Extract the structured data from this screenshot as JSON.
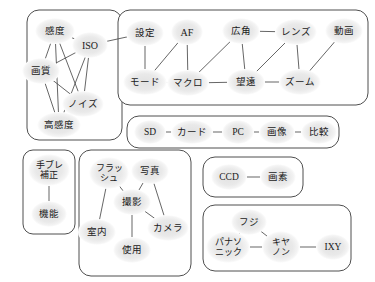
{
  "diagram": {
    "background_color": "#ffffff",
    "node_fill_color": "#e8e8e8",
    "node_text_color": "#1a1a1a",
    "edge_color": "#4a4a4a",
    "cluster_border_color": "#3a3a3a"
  },
  "clusters": [
    {
      "id": "c1",
      "x": 27,
      "y": 10,
      "w": 95,
      "h": 130,
      "r": 12
    },
    {
      "id": "c2",
      "x": 118,
      "y": 10,
      "w": 250,
      "h": 95,
      "r": 12
    },
    {
      "id": "c3",
      "x": 127,
      "y": 116,
      "w": 212,
      "h": 32,
      "r": 12
    },
    {
      "id": "c4",
      "x": 23,
      "y": 150,
      "w": 52,
      "h": 84,
      "r": 10
    },
    {
      "id": "c5",
      "x": 79,
      "y": 150,
      "w": 112,
      "h": 126,
      "r": 12
    },
    {
      "id": "c6",
      "x": 203,
      "y": 157,
      "w": 100,
      "h": 40,
      "r": 12
    },
    {
      "id": "c7",
      "x": 203,
      "y": 205,
      "w": 148,
      "h": 66,
      "r": 12
    }
  ],
  "nodes": [
    {
      "id": "kando",
      "label": "感度",
      "lines": [
        "感度"
      ],
      "x": 55,
      "y": 31,
      "rx": 20,
      "ry": 13,
      "fs": 9.5,
      "cluster": "c1"
    },
    {
      "id": "iso",
      "label": "ISO",
      "lines": [
        "ISO"
      ],
      "x": 90,
      "y": 45,
      "rx": 18,
      "ry": 13,
      "fs": 10,
      "cluster": "c1"
    },
    {
      "id": "gashitsu",
      "label": "画質",
      "lines": [
        "画質"
      ],
      "x": 41,
      "y": 71,
      "rx": 19,
      "ry": 13,
      "fs": 9.5,
      "cluster": "c1"
    },
    {
      "id": "noizu",
      "label": "ノイズ",
      "lines": [
        "ノイズ"
      ],
      "x": 83,
      "y": 104,
      "rx": 21,
      "ry": 13,
      "fs": 9.5,
      "cluster": "c1"
    },
    {
      "id": "koukando",
      "label": "高感度",
      "lines": [
        "高感度"
      ],
      "x": 59,
      "y": 125,
      "rx": 22,
      "ry": 13,
      "fs": 9.5,
      "cluster": "c1"
    },
    {
      "id": "settei",
      "label": "設定",
      "lines": [
        "設定"
      ],
      "x": 145,
      "y": 33,
      "rx": 19,
      "ry": 13,
      "fs": 9.5,
      "cluster": "c2"
    },
    {
      "id": "af",
      "label": "AF",
      "lines": [
        "AF"
      ],
      "x": 187,
      "y": 32,
      "rx": 16,
      "ry": 13,
      "fs": 10,
      "cluster": "c2"
    },
    {
      "id": "koukaku",
      "label": "広角",
      "lines": [
        "広角"
      ],
      "x": 241,
      "y": 31,
      "rx": 19,
      "ry": 13,
      "fs": 9.5,
      "cluster": "c2"
    },
    {
      "id": "renzu",
      "label": "レンズ",
      "lines": [
        "レンズ"
      ],
      "x": 296,
      "y": 32,
      "rx": 21,
      "ry": 13,
      "fs": 9.5,
      "cluster": "c2"
    },
    {
      "id": "douga",
      "label": "動画",
      "lines": [
        "動画"
      ],
      "x": 344,
      "y": 31,
      "rx": 19,
      "ry": 13,
      "fs": 9.5,
      "cluster": "c2"
    },
    {
      "id": "mode",
      "label": "モード",
      "lines": [
        "モード"
      ],
      "x": 145,
      "y": 82,
      "rx": 22,
      "ry": 13,
      "fs": 9.5,
      "cluster": "c2"
    },
    {
      "id": "makuro",
      "label": "マクロ",
      "lines": [
        "マクロ"
      ],
      "x": 188,
      "y": 83,
      "rx": 21,
      "ry": 13,
      "fs": 9.5,
      "cluster": "c2"
    },
    {
      "id": "bouen",
      "label": "望遠",
      "lines": [
        "望遠"
      ],
      "x": 246,
      "y": 82,
      "rx": 19,
      "ry": 13,
      "fs": 9.5,
      "cluster": "c2"
    },
    {
      "id": "zoom",
      "label": "ズーム",
      "lines": [
        "ズーム"
      ],
      "x": 300,
      "y": 82,
      "rx": 21,
      "ry": 13,
      "fs": 9.5,
      "cluster": "c2"
    },
    {
      "id": "sd",
      "label": "SD",
      "lines": [
        "SD"
      ],
      "x": 150,
      "y": 132,
      "rx": 16,
      "ry": 12,
      "fs": 9.5,
      "cluster": "c3"
    },
    {
      "id": "kaado",
      "label": "カード",
      "lines": [
        "カード"
      ],
      "x": 192,
      "y": 132,
      "rx": 21,
      "ry": 12,
      "fs": 9.5,
      "cluster": "c3"
    },
    {
      "id": "pc",
      "label": "PC",
      "lines": [
        "PC"
      ],
      "x": 238,
      "y": 132,
      "rx": 16,
      "ry": 12,
      "fs": 9.5,
      "cluster": "c3"
    },
    {
      "id": "gazou",
      "label": "画像",
      "lines": [
        "画像"
      ],
      "x": 277,
      "y": 132,
      "rx": 18,
      "ry": 12,
      "fs": 9.5,
      "cluster": "c3"
    },
    {
      "id": "hikaku",
      "label": "比較",
      "lines": [
        "比較"
      ],
      "x": 319,
      "y": 132,
      "rx": 18,
      "ry": 12,
      "fs": 9.5,
      "cluster": "c3"
    },
    {
      "id": "tebure",
      "label": "手ブレ補正",
      "lines": [
        "手ブレ",
        "補正"
      ],
      "x": 49,
      "y": 170,
      "rx": 21,
      "ry": 16,
      "fs": 9,
      "cluster": "c4"
    },
    {
      "id": "kinou",
      "label": "機能",
      "lines": [
        "機能"
      ],
      "x": 49,
      "y": 214,
      "rx": 18,
      "ry": 13,
      "fs": 9.5,
      "cluster": "c4"
    },
    {
      "id": "flash",
      "label": "フラッシュ",
      "lines": [
        "フラッ",
        "シュ"
      ],
      "x": 109,
      "y": 173,
      "rx": 20,
      "ry": 16,
      "fs": 9,
      "cluster": "c5"
    },
    {
      "id": "shashin",
      "label": "写真",
      "lines": [
        "写真"
      ],
      "x": 150,
      "y": 171,
      "rx": 19,
      "ry": 13,
      "fs": 9.5,
      "cluster": "c5"
    },
    {
      "id": "satsuei",
      "label": "撮影",
      "lines": [
        "撮影"
      ],
      "x": 132,
      "y": 202,
      "rx": 19,
      "ry": 13,
      "fs": 9.5,
      "cluster": "c5"
    },
    {
      "id": "shitsunai",
      "label": "室内",
      "lines": [
        "室内"
      ],
      "x": 97,
      "y": 232,
      "rx": 19,
      "ry": 13,
      "fs": 9.5,
      "cluster": "c5"
    },
    {
      "id": "camera",
      "label": "カメラ",
      "lines": [
        "カメラ"
      ],
      "x": 168,
      "y": 228,
      "rx": 21,
      "ry": 13,
      "fs": 9.5,
      "cluster": "c5"
    },
    {
      "id": "shiyou",
      "label": "使用",
      "lines": [
        "使用"
      ],
      "x": 132,
      "y": 250,
      "rx": 19,
      "ry": 13,
      "fs": 9.5,
      "cluster": "c5"
    },
    {
      "id": "ccd",
      "label": "CCD",
      "lines": [
        "CCD"
      ],
      "x": 229,
      "y": 177,
      "rx": 18,
      "ry": 13,
      "fs": 9.5,
      "cluster": "c6"
    },
    {
      "id": "gaso",
      "label": "画素",
      "lines": [
        "画素"
      ],
      "x": 278,
      "y": 177,
      "rx": 18,
      "ry": 13,
      "fs": 9.5,
      "cluster": "c6"
    },
    {
      "id": "fuji",
      "label": "フジ",
      "lines": [
        "フジ"
      ],
      "x": 249,
      "y": 222,
      "rx": 18,
      "ry": 13,
      "fs": 9.5,
      "cluster": "c7"
    },
    {
      "id": "panasonic",
      "label": "パナソニック",
      "lines": [
        "パナソ",
        "ニック"
      ],
      "x": 228,
      "y": 247,
      "rx": 22,
      "ry": 16,
      "fs": 9,
      "cluster": "c7"
    },
    {
      "id": "canon",
      "label": "キヤノン",
      "lines": [
        "キヤ",
        "ノン"
      ],
      "x": 281,
      "y": 247,
      "rx": 19,
      "ry": 16,
      "fs": 9,
      "cluster": "c7"
    },
    {
      "id": "ixy",
      "label": "IXY",
      "lines": [
        "IXY"
      ],
      "x": 333,
      "y": 247,
      "rx": 17,
      "ry": 13,
      "fs": 9.5,
      "cluster": "c7"
    }
  ],
  "edges": [
    {
      "from": "kando",
      "to": "iso"
    },
    {
      "from": "kando",
      "to": "gashitsu"
    },
    {
      "from": "kando",
      "to": "noizu"
    },
    {
      "from": "kando",
      "to": "koukando"
    },
    {
      "from": "iso",
      "to": "gashitsu"
    },
    {
      "from": "iso",
      "to": "noizu"
    },
    {
      "from": "iso",
      "to": "koukando"
    },
    {
      "from": "gashitsu",
      "to": "noizu"
    },
    {
      "from": "gashitsu",
      "to": "koukando"
    },
    {
      "from": "noizu",
      "to": "koukando"
    },
    {
      "from": "iso",
      "to": "settei"
    },
    {
      "from": "settei",
      "to": "mode"
    },
    {
      "from": "af",
      "to": "mode"
    },
    {
      "from": "af",
      "to": "makuro"
    },
    {
      "from": "mode",
      "to": "makuro"
    },
    {
      "from": "koukaku",
      "to": "makuro"
    },
    {
      "from": "koukaku",
      "to": "renzu"
    },
    {
      "from": "koukaku",
      "to": "bouen"
    },
    {
      "from": "makuro",
      "to": "bouen"
    },
    {
      "from": "renzu",
      "to": "bouen"
    },
    {
      "from": "renzu",
      "to": "zoom"
    },
    {
      "from": "bouen",
      "to": "zoom"
    },
    {
      "from": "douga",
      "to": "zoom"
    },
    {
      "from": "sd",
      "to": "kaado"
    },
    {
      "from": "kaado",
      "to": "pc"
    },
    {
      "from": "pc",
      "to": "gazou"
    },
    {
      "from": "gazou",
      "to": "hikaku"
    },
    {
      "from": "tebure",
      "to": "kinou"
    },
    {
      "from": "flash",
      "to": "satsuei"
    },
    {
      "from": "flash",
      "to": "shitsunai"
    },
    {
      "from": "shashin",
      "to": "satsuei"
    },
    {
      "from": "shashin",
      "to": "camera"
    },
    {
      "from": "satsuei",
      "to": "camera"
    },
    {
      "from": "satsuei",
      "to": "shiyou"
    },
    {
      "from": "ccd",
      "to": "gaso"
    },
    {
      "from": "fuji",
      "to": "panasonic"
    },
    {
      "from": "fuji",
      "to": "canon"
    },
    {
      "from": "panasonic",
      "to": "canon"
    },
    {
      "from": "canon",
      "to": "ixy"
    }
  ]
}
